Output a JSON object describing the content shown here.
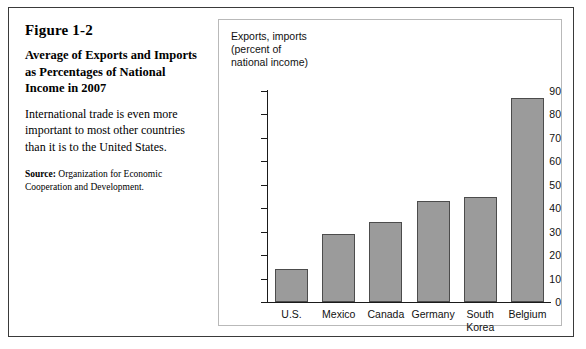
{
  "figure": {
    "number": "Figure 1-2",
    "title": "Average of Exports and Imports as Percentages of National Income in 2007",
    "description": "International trade is even more important to most other countries than it is to the United States.",
    "source_label": "Source:",
    "source_text": "Organization for Economic Cooperation and Development."
  },
  "chart_data": {
    "type": "bar",
    "title": "",
    "axis_note": "Exports, imports\n(percent of\nnational income)",
    "categories": [
      "U.S.",
      "Mexico",
      "Canada",
      "Germany",
      "South\nKorea",
      "Belgium"
    ],
    "values": [
      14,
      29,
      34,
      43,
      45,
      87
    ],
    "xlabel": "",
    "ylabel": "Exports, imports (percent of national income)",
    "ylim": [
      0,
      90
    ],
    "ytick_step": 10,
    "yticks": [
      0,
      10,
      20,
      30,
      40,
      50,
      60,
      70,
      80,
      90
    ],
    "grid": false,
    "legend": "none",
    "bar_color": "#9b9b9b",
    "bar_border_color": "#4c4c4c",
    "axis_color": "#1a1a1a"
  },
  "colors": {
    "figure_border": "#3a3a3a",
    "panel_border": "#b9b9b9",
    "background": "#ffffff",
    "text": "#000000"
  }
}
